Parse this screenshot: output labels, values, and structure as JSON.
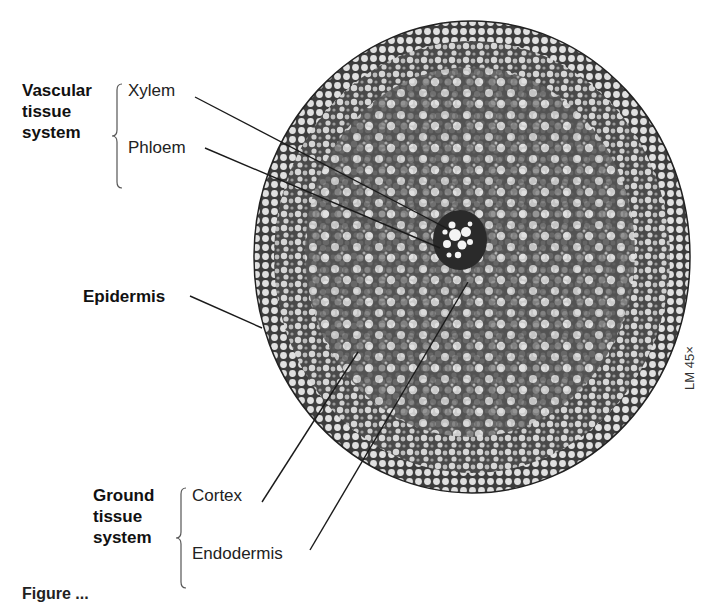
{
  "figure": {
    "scale_label": "LM 45×",
    "background": "#ffffff",
    "tissue_colors": {
      "cell_wall": "#3a3a3a",
      "cell_lumen": "#d8d8d8",
      "dense_cells": "#6a6a6a",
      "vascular_core": "#2a2a2a",
      "xylem_vessel": "#f4f4f4"
    }
  },
  "groups": {
    "vascular": {
      "title_lines": [
        "Vascular",
        "tissue",
        "system"
      ],
      "items": [
        {
          "label": "Xylem"
        },
        {
          "label": "Phloem"
        }
      ]
    },
    "epidermis": {
      "label": "Epidermis"
    },
    "ground": {
      "title_lines": [
        "Ground",
        "tissue",
        "system"
      ],
      "items": [
        {
          "label": "Cortex"
        },
        {
          "label": "Endodermis"
        }
      ]
    }
  },
  "caption_partial": "Figure ..."
}
